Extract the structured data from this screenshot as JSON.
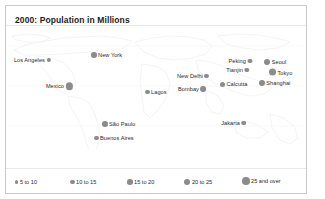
{
  "figure": {
    "title": "2000: Population in Millions",
    "dot_color": "#8b8b8b",
    "border_color": "#c9c9c9",
    "background": "#ffffff"
  },
  "chart_data": {
    "type": "scatter",
    "title": "2000: Population in Millions",
    "xlabel": "",
    "ylabel": "",
    "units": "millions",
    "projection": "world-map",
    "size_encoding": "population bucket",
    "cities": [
      {
        "name": "Los Angeles",
        "bucket": "10 to 15",
        "size": 4.6,
        "x": 45,
        "y": 54,
        "label_side": "left"
      },
      {
        "name": "New York",
        "bucket": "15 to 20",
        "size": 5.6,
        "x": 85,
        "y": 49,
        "label_side": "right"
      },
      {
        "name": "Mexico",
        "bucket": "25 and over",
        "size": 7.6,
        "x": 67,
        "y": 80,
        "label_side": "left"
      },
      {
        "name": "Lagos",
        "bucket": "10 to 15",
        "size": 4.6,
        "x": 139,
        "y": 86,
        "label_side": "right"
      },
      {
        "name": "São Paulo",
        "bucket": "15 to 20",
        "size": 5.6,
        "x": 96,
        "y": 118,
        "label_side": "right"
      },
      {
        "name": "Buenos Aires",
        "bucket": "10 to 15",
        "size": 4.6,
        "x": 88,
        "y": 132,
        "label_side": "right"
      },
      {
        "name": "New Delhi",
        "bucket": "10 to 15",
        "size": 4.6,
        "x": 203,
        "y": 70,
        "label_side": "left"
      },
      {
        "name": "Bombay",
        "bucket": "15 to 20",
        "size": 5.6,
        "x": 200,
        "y": 83,
        "label_side": "left"
      },
      {
        "name": "Calcutta",
        "bucket": "10 to 15",
        "size": 5.0,
        "x": 214,
        "y": 78,
        "label_side": "right"
      },
      {
        "name": "Peking",
        "bucket": "10 to 15",
        "size": 4.6,
        "x": 246,
        "y": 55,
        "label_side": "left"
      },
      {
        "name": "Tianjin",
        "bucket": "10 to 15",
        "size": 4.6,
        "x": 243,
        "y": 64,
        "label_side": "left"
      },
      {
        "name": "Seoul",
        "bucket": "20 to 25",
        "size": 6.2,
        "x": 258,
        "y": 56,
        "label_side": "right"
      },
      {
        "name": "Tokyo",
        "bucket": "25 and over",
        "size": 7.0,
        "x": 263,
        "y": 66,
        "label_side": "right"
      },
      {
        "name": "Shanghai",
        "bucket": "15 to 20",
        "size": 5.8,
        "x": 253,
        "y": 77,
        "label_side": "right"
      },
      {
        "name": "Jakarta",
        "bucket": "10 to 15",
        "size": 4.6,
        "x": 240,
        "y": 117,
        "label_side": "left"
      }
    ],
    "legend": {
      "position": "bottom",
      "entries": [
        {
          "label": "5 to 10",
          "size": 3.4,
          "x": 9
        },
        {
          "label": "10 to 15",
          "size": 4.6,
          "x": 64
        },
        {
          "label": "15 to 20",
          "size": 5.6,
          "x": 121
        },
        {
          "label": "20 to 25",
          "size": 6.4,
          "x": 178
        },
        {
          "label": "25 and over",
          "size": 7.6,
          "x": 236
        }
      ]
    }
  }
}
